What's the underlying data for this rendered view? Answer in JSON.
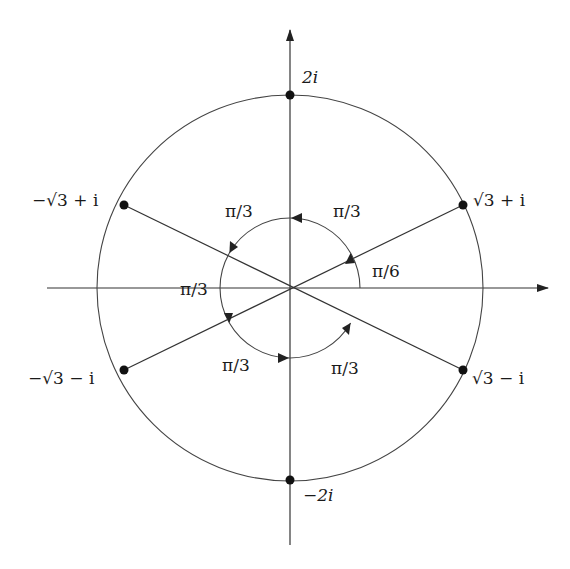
{
  "diagram": {
    "type": "complex-plane-roots",
    "center": {
      "x": 290,
      "y": 288
    },
    "outer_radius": 193,
    "inner_radius": 70,
    "colors": {
      "stroke": "#333333",
      "text": "#1a1a1a",
      "background": "#ffffff"
    },
    "points": [
      {
        "id": "p-2i",
        "label": "2i",
        "angle_deg": 90
      },
      {
        "id": "p-sqrt3-plus-i",
        "label": "√3 + i",
        "angle_deg": 30
      },
      {
        "id": "p-neg-sqrt3-plus-i",
        "label": "−√3 + i",
        "angle_deg": 150
      },
      {
        "id": "p-neg-sqrt3-minus-i",
        "label": "−√3 − i",
        "angle_deg": 210
      },
      {
        "id": "p-sqrt3-minus-i",
        "label": "√3 − i",
        "angle_deg": 330
      },
      {
        "id": "p-neg-2i",
        "label": "−2i",
        "angle_deg": 270
      }
    ],
    "angle_labels": {
      "first": "π/6",
      "top_right": "π/3",
      "top_left": "π/3",
      "left": "π/3",
      "bottom_left": "π/3",
      "bottom_right": "π/3"
    }
  }
}
